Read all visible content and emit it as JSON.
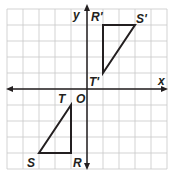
{
  "grid": {
    "xmin": -5,
    "xmax": 5,
    "ymin": -5,
    "ymax": 5,
    "cell_px": 16,
    "origin_px": [
      87,
      89
    ],
    "grid_color": "#c8c8c8",
    "axis_color": "#231f20"
  },
  "axes": {
    "x_label": "x",
    "y_label": "y",
    "origin_label": "O"
  },
  "figures": {
    "original": {
      "name": "triangle RST",
      "vertices": [
        {
          "label": "R",
          "x": -1,
          "y": -4
        },
        {
          "label": "S",
          "x": -3,
          "y": -4
        },
        {
          "label": "T",
          "x": -1,
          "y": -1
        }
      ]
    },
    "image": {
      "name": "triangle R'S'T'",
      "vertices": [
        {
          "label": "R'",
          "x": 1,
          "y": 4
        },
        {
          "label": "S'",
          "x": 3,
          "y": 4
        },
        {
          "label": "T'",
          "x": 1,
          "y": 1
        }
      ]
    }
  }
}
